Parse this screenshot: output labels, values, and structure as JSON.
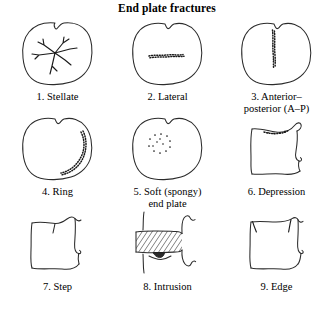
{
  "title": "End plate fractures",
  "figures": [
    {
      "id": "stellate",
      "caption": "1. Stellate",
      "view": "axial",
      "fracture_pattern": "radiating star-shaped cracks from center"
    },
    {
      "id": "lateral",
      "caption": "2. Lateral",
      "view": "axial",
      "fracture_pattern": "horizontal stippled line across mid body"
    },
    {
      "id": "anterior-posterior",
      "caption": "3. Anterior–\nposterior (A–P)",
      "view": "axial",
      "fracture_pattern": "vertical stippled line through center"
    },
    {
      "id": "ring",
      "caption": "4. Ring",
      "view": "axial",
      "fracture_pattern": "peripheral arc along right margin"
    },
    {
      "id": "soft-spongy-end-plate",
      "caption": "5. Soft (spongy)\nend plate",
      "view": "axial",
      "fracture_pattern": "dotted oval region in upper left quadrant"
    },
    {
      "id": "depression",
      "caption": "6. Depression",
      "view": "lateral",
      "fracture_pattern": "concave depressed superior end plate with stipples"
    },
    {
      "id": "step",
      "caption": "7. Step",
      "view": "lateral",
      "fracture_pattern": "step-off deformity of superior end plate"
    },
    {
      "id": "intrusion",
      "caption": "8. Intrusion",
      "view": "lateral",
      "fracture_pattern": "hatched disc band with dark nodule intruding into body"
    },
    {
      "id": "edge",
      "caption": "9. Edge",
      "view": "lateral",
      "fracture_pattern": "oblique cracks at both superior corners"
    }
  ],
  "colors": {
    "background": "#ffffff",
    "outline": "#2b2b2b",
    "fracture": "#1a1a1a",
    "text": "#000000"
  }
}
